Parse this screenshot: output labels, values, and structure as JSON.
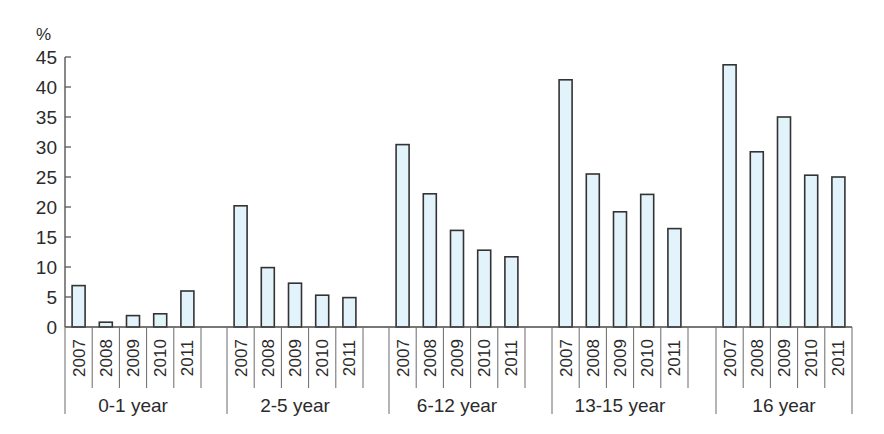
{
  "chart_data": {
    "type": "bar",
    "title": "",
    "xlabel": "",
    "ylabel": "%",
    "ylim": [
      0,
      45
    ],
    "yticks": [
      0,
      5,
      10,
      15,
      20,
      25,
      30,
      35,
      40,
      45
    ],
    "grid": false,
    "legend": null,
    "bar_fill": "#e3f3fb",
    "bar_stroke": "#333333",
    "groups": [
      "0-1 year",
      "2-5 year",
      "6-12 year",
      "13-15 year",
      "16 year"
    ],
    "years": [
      "2007",
      "2008",
      "2009",
      "2010",
      "2011"
    ],
    "series": [
      {
        "group": "0-1 year",
        "values": [
          6.9,
          0.8,
          1.9,
          2.2,
          6.0
        ]
      },
      {
        "group": "2-5 year",
        "values": [
          20.2,
          9.9,
          7.3,
          5.3,
          4.9
        ]
      },
      {
        "group": "6-12 year",
        "values": [
          30.4,
          22.2,
          16.1,
          12.8,
          11.7
        ]
      },
      {
        "group": "13-15 year",
        "values": [
          41.2,
          25.5,
          19.2,
          22.1,
          16.4
        ]
      },
      {
        "group": "16 year",
        "values": [
          43.7,
          29.2,
          35.0,
          25.3,
          25.0
        ]
      }
    ]
  },
  "axis": {
    "unit_label": "%"
  }
}
